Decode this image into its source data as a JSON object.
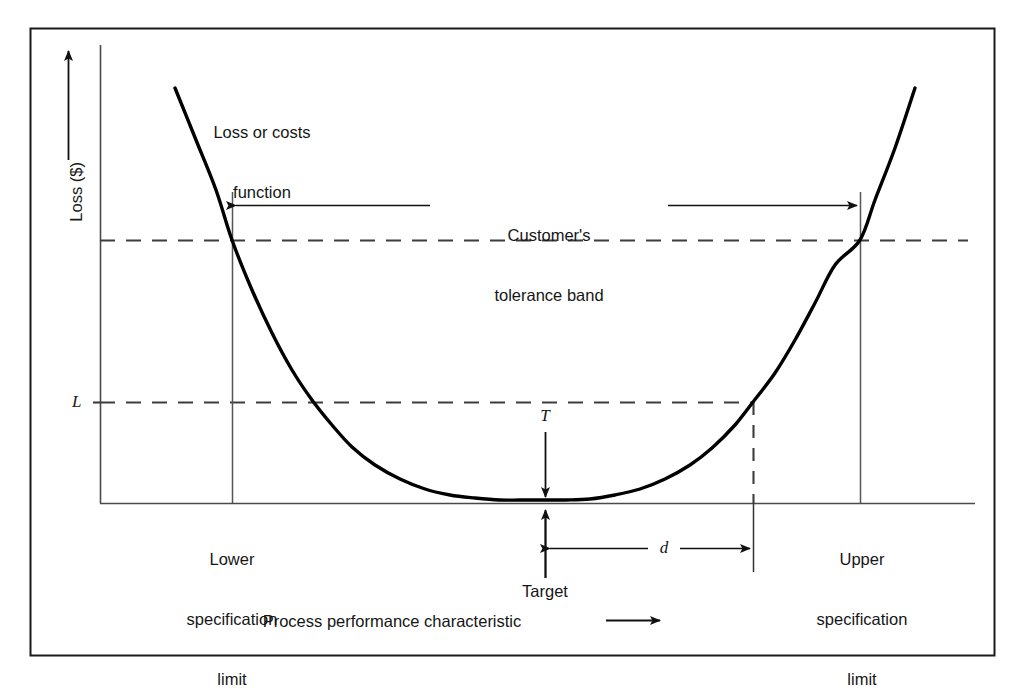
{
  "figure": {
    "type": "taguchi-loss-function-diagram",
    "background_color": "#ffffff",
    "frame_color": "#1a1a1a",
    "curve_color": "#000000",
    "axis_color": "#333333",
    "dash_color": "#444444"
  },
  "axes": {
    "y_label": "Loss ($)",
    "x_label": "Process performance characteristic",
    "y_tick_label": "L",
    "x_axis_arrow": "right-arrow",
    "y_axis_arrow": "up-arrow"
  },
  "annotations": {
    "curve_label_line1": "Loss or costs",
    "curve_label_line2": "function",
    "tolerance_line1": "Customer's",
    "tolerance_line2": "tolerance band",
    "lower_spec_line1": "Lower",
    "lower_spec_line2": "specification",
    "lower_spec_line3": "limit",
    "upper_spec_line1": "Upper",
    "upper_spec_line2": "specification",
    "upper_spec_line3": "limit",
    "target_label": "Target",
    "target_symbol": "T",
    "deviation_symbol": "d",
    "loss_symbol": "L"
  },
  "chart_data": {
    "type": "line",
    "title": "",
    "subtitle": "",
    "xlabel": "Process performance characteristic",
    "ylabel": "Loss ($)",
    "curve_form": "quadratic loss function L = k(x - T)^2",
    "grid": false,
    "legend": null,
    "xlim": [
      0,
      1
    ],
    "ylim": [
      0,
      1
    ],
    "axis_tick_labels": {
      "y": [
        "L"
      ],
      "x": []
    },
    "markers": {
      "target": {
        "label": "Target",
        "symbol": "T",
        "x_px": 545
      },
      "lower_specification_limit": {
        "label": "Lower specification limit",
        "x_px": 232
      },
      "upper_specification_limit": {
        "label": "Upper specification limit",
        "x_px": 860
      },
      "deviation_d": {
        "symbol": "d",
        "from_x_px": 548,
        "to_x_px": 752
      },
      "loss_level_L": {
        "symbol": "L",
        "y_px": 402
      },
      "tolerance_band_loss_level": {
        "y_px": 240
      }
    },
    "series": [
      {
        "name": "Loss or costs function",
        "points_px": [
          [
            175,
            88
          ],
          [
            196,
            140
          ],
          [
            216,
            190
          ],
          [
            232,
            240
          ],
          [
            252,
            290
          ],
          [
            272,
            333
          ],
          [
            292,
            370
          ],
          [
            312,
            400
          ],
          [
            332,
            425
          ],
          [
            352,
            447
          ],
          [
            375,
            465
          ],
          [
            400,
            479
          ],
          [
            425,
            489
          ],
          [
            450,
            495
          ],
          [
            475,
            498
          ],
          [
            500,
            500
          ],
          [
            520,
            500
          ],
          [
            543,
            500
          ],
          [
            566,
            500
          ],
          [
            590,
            499
          ],
          [
            615,
            495
          ],
          [
            640,
            489
          ],
          [
            665,
            479
          ],
          [
            690,
            465
          ],
          [
            712,
            448
          ],
          [
            735,
            425
          ],
          [
            753,
            402
          ],
          [
            775,
            373
          ],
          [
            795,
            340
          ],
          [
            815,
            303
          ],
          [
            835,
            265
          ],
          [
            860,
            240
          ],
          [
            875,
            200
          ],
          [
            895,
            148
          ],
          [
            915,
            88
          ]
        ]
      }
    ]
  }
}
